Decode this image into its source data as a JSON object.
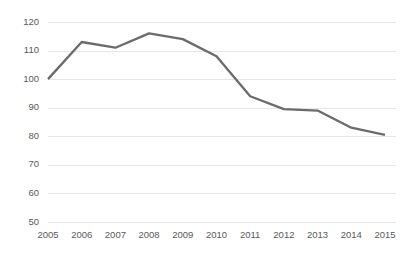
{
  "chart_data": {
    "type": "line",
    "title": "",
    "subtitle": "",
    "xlabel": "",
    "ylabel": "",
    "categories": [
      "2005",
      "2006",
      "2007",
      "2008",
      "2009",
      "2010",
      "2011",
      "2012",
      "2013",
      "2014",
      "2015"
    ],
    "x": [
      2005,
      2006,
      2007,
      2008,
      2009,
      2010,
      2011,
      2012,
      2013,
      2014,
      2015
    ],
    "values": [
      100,
      113,
      111,
      116,
      114,
      108,
      94,
      89.5,
      89,
      83,
      80.5
    ],
    "series": [
      {
        "name": "",
        "values": [
          100,
          113,
          111,
          116,
          114,
          108,
          94,
          89.5,
          89,
          83,
          80.5
        ],
        "color": "#6B6B6B"
      }
    ],
    "ylim": [
      50,
      120
    ],
    "xlim": [
      2005,
      2015
    ],
    "yticks": [
      50,
      60,
      70,
      80,
      90,
      100,
      110,
      120
    ],
    "ytick_labels": [
      "50",
      "60",
      "70",
      "80",
      "90",
      "100",
      "110",
      "120"
    ],
    "xtick_labels": [
      "2005",
      "2006",
      "2007",
      "2008",
      "2009",
      "2010",
      "2011",
      "2012",
      "2013",
      "2014",
      "2015"
    ],
    "grid": {
      "horizontal": true,
      "vertical": false,
      "color": "#E6E6E6"
    },
    "legend": {
      "visible": false,
      "position": "none",
      "entries": []
    },
    "colors": {
      "line": "#6B6B6B",
      "grid": "#E6E6E6",
      "tick_label": "#595959",
      "background": "#FFFFFF"
    },
    "annotations": []
  },
  "layout": {
    "plot_left": 48,
    "plot_right": 396,
    "plot_top": 22,
    "plot_bottom": 222,
    "xaxis_label_y": 231,
    "data_left": 48,
    "data_right": 385
  }
}
